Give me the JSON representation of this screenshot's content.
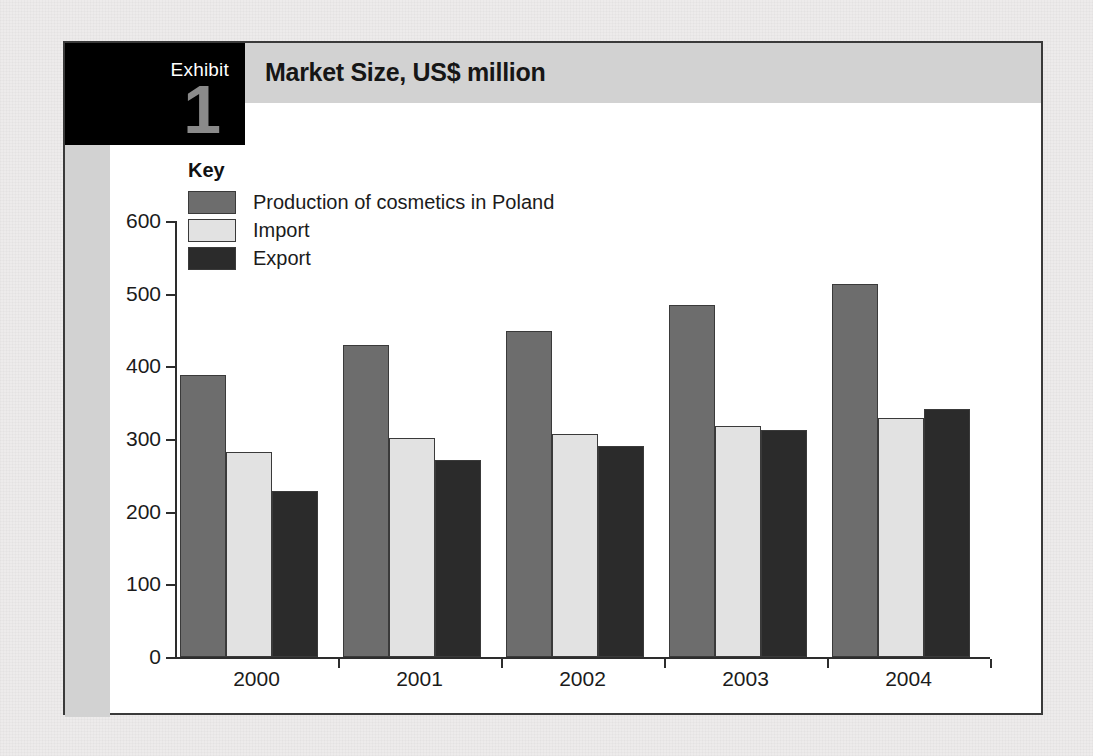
{
  "exhibit": {
    "label": "Exhibit",
    "number": "1"
  },
  "header": {
    "title": "Market Size, US$ million"
  },
  "legend": {
    "title": "Key",
    "items": [
      {
        "label": "Production of cosmetics in Poland",
        "swatch": "prod",
        "color": "#6d6d6d"
      },
      {
        "label": "Import",
        "swatch": "imp",
        "color": "#e2e2e2"
      },
      {
        "label": "Export",
        "swatch": "exp",
        "color": "#2b2b2b"
      }
    ]
  },
  "chart_data": {
    "type": "bar",
    "title": "Market Size, US$ million",
    "xlabel": "",
    "ylabel": "",
    "categories": [
      "2000",
      "2001",
      "2002",
      "2003",
      "2004"
    ],
    "series": [
      {
        "name": "Production of cosmetics in Poland",
        "color": "#6d6d6d",
        "values": [
          388,
          430,
          448,
          484,
          514
        ]
      },
      {
        "name": "Import",
        "color": "#e2e2e2",
        "values": [
          282,
          302,
          307,
          318,
          329
        ]
      },
      {
        "name": "Export",
        "color": "#2b2b2b",
        "values": [
          229,
          271,
          291,
          313,
          341
        ]
      }
    ],
    "ylim": [
      0,
      600
    ],
    "yticks": [
      0,
      100,
      200,
      300,
      400,
      500,
      600
    ],
    "ytick_labels": [
      "0",
      "100",
      "200",
      "300",
      "400",
      "500",
      "600"
    ],
    "grid": false,
    "legend_position": "inside-top-left",
    "units": "US$ million"
  },
  "colors": {
    "frame": "#3a3a3a",
    "band": "#d2d2d2",
    "exhibit_box": "#000000",
    "exhibit_number": "#8a8a8a",
    "page_background": "#edebeb"
  }
}
